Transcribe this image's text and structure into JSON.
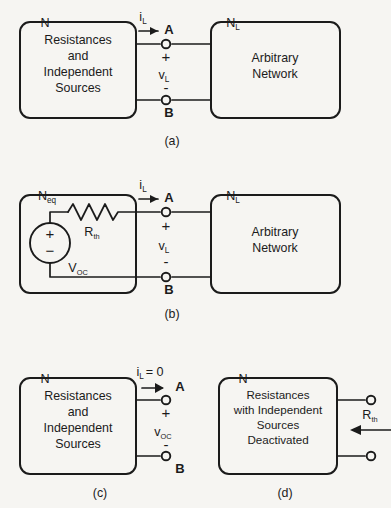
{
  "figure": {
    "background_color": "#f6f5f2",
    "line_color": "#1b1b1b"
  },
  "panels": [
    {
      "id": "a",
      "caption": "(a)",
      "source_box": {
        "node_label": "N",
        "lines": [
          "Resistances",
          "and",
          "Independent",
          "Sources"
        ]
      },
      "load_box": {
        "node_label": "N",
        "node_sub": "L",
        "lines": [
          "Arbitrary",
          "Network"
        ]
      },
      "current": {
        "symbol": "i",
        "sub": "L"
      },
      "terminal_top": "A",
      "terminal_bottom": "B",
      "polarity_plus": "+",
      "polarity_minus": "-",
      "voltage": {
        "symbol": "v",
        "sub": "L"
      }
    },
    {
      "id": "b",
      "caption": "(b)",
      "source_box": {
        "node_label": "N",
        "node_sub": "eq",
        "resistor_label": {
          "symbol": "R",
          "sub": "th"
        },
        "source_label": {
          "symbol": "V",
          "sub": "OC"
        },
        "source_plus": "+",
        "source_minus": "−"
      },
      "load_box": {
        "node_label": "N",
        "node_sub": "L",
        "lines": [
          "Arbitrary",
          "Network"
        ]
      },
      "current": {
        "symbol": "i",
        "sub": "L"
      },
      "terminal_top": "A",
      "terminal_bottom": "B",
      "polarity_plus": "+",
      "polarity_minus": "-",
      "voltage": {
        "symbol": "v",
        "sub": "L"
      }
    },
    {
      "id": "c",
      "caption": "(c)",
      "source_box": {
        "node_label": "N",
        "lines": [
          "Resistances",
          "and",
          "Independent",
          "Sources"
        ]
      },
      "current": {
        "symbol": "i",
        "sub": "L",
        "value": "= 0"
      },
      "terminal_top": "A",
      "terminal_bottom": "B",
      "polarity_plus": "+",
      "polarity_minus": "-",
      "voltage": {
        "symbol": "v",
        "sub": "OC"
      }
    },
    {
      "id": "d",
      "caption": "(d)",
      "source_box": {
        "node_label": "N",
        "lines": [
          "Resistances",
          "with Independent",
          "Sources",
          "Deactivated"
        ]
      },
      "resistance": {
        "symbol": "R",
        "sub": "th"
      }
    }
  ]
}
